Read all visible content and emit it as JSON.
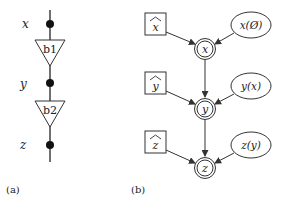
{
  "panel_a": {
    "caption": "(a)",
    "vars": [
      {
        "label": "x",
        "y": 24
      },
      {
        "label": "y",
        "y": 83
      },
      {
        "label": "z",
        "y": 145
      }
    ],
    "blocks": [
      {
        "label": "b1",
        "top": 40
      },
      {
        "label": "b2",
        "top": 101
      }
    ]
  },
  "panel_b": {
    "caption": "(b)",
    "rows": [
      {
        "hat": "x̂",
        "hat_letter": "x",
        "node": "x",
        "prior": "x(Ø)",
        "cy": 49
      },
      {
        "hat": "ŷ",
        "hat_letter": "y",
        "node": "y",
        "prior": "y(x)",
        "cy": 109
      },
      {
        "hat": "ẑ",
        "hat_letter": "z",
        "node": "z",
        "prior": "z(y)",
        "cy": 168
      }
    ]
  },
  "colors": {
    "stroke": "#333333",
    "text": "#222222"
  }
}
